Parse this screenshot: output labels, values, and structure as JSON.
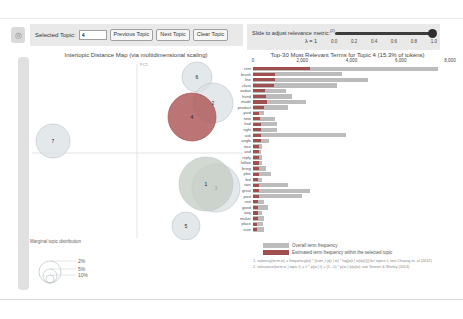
{
  "controls": {
    "selected_topic_label": "Selected Topic:",
    "selected_topic_value": "4",
    "prev_button": "Previous Topic",
    "next_button": "Next Topic",
    "clear_button": "Clear Topic",
    "slider_label": "Slide to adjust relevance metric:",
    "slider_superscript": "(2)",
    "lambda_label": "λ = 1",
    "slider_value": 1.0,
    "slider_ticks": [
      "0.0",
      "0.2",
      "0.4",
      "0.6",
      "0.8",
      "1.0"
    ]
  },
  "map": {
    "title": "Intertopic Distance Map (via multidimensional scaling)",
    "y_axis_label": "PC2",
    "selected_color": "#b05c5c",
    "default_color": "#d9e0e4",
    "topics": [
      {
        "id": "7",
        "x": 23,
        "y": 81,
        "r": 17,
        "selected": false,
        "fill": "#d9e0e4"
      },
      {
        "id": "6",
        "x": 167,
        "y": 17,
        "r": 15,
        "selected": false,
        "fill": "#d9e0e4"
      },
      {
        "id": "2",
        "x": 183,
        "y": 43,
        "r": 20,
        "selected": false,
        "fill": "#d9e0e4"
      },
      {
        "id": "4",
        "x": 162,
        "y": 57,
        "r": 24,
        "selected": true,
        "fill": "#b05c5c"
      },
      {
        "id": "3",
        "x": 186,
        "y": 128,
        "r": 24,
        "selected": false,
        "fill": "#d9e0e4"
      },
      {
        "id": "1",
        "x": 176,
        "y": 124,
        "r": 27,
        "selected": false,
        "fill": "#c3ccc1"
      },
      {
        "id": "5",
        "x": 156,
        "y": 166,
        "r": 14,
        "selected": false,
        "fill": "#d9e0e4"
      }
    ],
    "size_legend": {
      "title": "Marginal topic distribution",
      "sizes": [
        "2%",
        "5%",
        "10%"
      ]
    }
  },
  "chart_data": {
    "type": "bar",
    "title": "Top-30 Most Relevant Terms for Topic 4 (15.3% of tokens)",
    "xlim": [
      0,
      8000
    ],
    "x_ticks": [
      "0",
      "2,000",
      "4,000",
      "6,000",
      "8,000"
    ],
    "x_tick_values": [
      0,
      2000,
      4000,
      6000,
      8000
    ],
    "orientation": "horizontal",
    "categories": [
      "rent",
      "brush",
      "line",
      "class",
      "sedan",
      "hand",
      "made",
      "product",
      "yard",
      "new",
      "had",
      "right",
      "ask",
      "angle",
      "nice",
      "and",
      "reply",
      "follow",
      "bring",
      "plan",
      "but",
      "size",
      "great",
      "post",
      "unit",
      "good",
      "way",
      "maker",
      "place",
      "sure"
    ],
    "series": [
      {
        "name": "Overall term frequency",
        "color": "#bcbcbc",
        "values": [
          7500,
          3600,
          4650,
          3400,
          1330,
          1600,
          2160,
          1440,
          430,
          880,
          960,
          980,
          3760,
          640,
          380,
          330,
          350,
          360,
          520,
          720,
          360,
          1440,
          2320,
          1970,
          460,
          620,
          360,
          430,
          410,
          460
        ]
      },
      {
        "name": "Estimated term frequency within the selected topic",
        "color": "#a04f4f",
        "values": [
          2300,
          900,
          880,
          850,
          480,
          530,
          560,
          430,
          240,
          270,
          320,
          320,
          330,
          320,
          240,
          230,
          230,
          230,
          230,
          250,
          220,
          260,
          240,
          230,
          200,
          200,
          190,
          190,
          180,
          180
        ]
      }
    ],
    "legend_position": "bottom"
  },
  "footnotes": [
    "1. saliency(term w) = frequency(w) * [sum_t p(t | w) * log(p(t | w)/p(t))] for topics t; see Chuang et. al (2012)",
    "2. relevance(term w | topic t) = λ * p(w | t) + (1 - λ) * p(w | t)/p(w); see Sievert & Shirley (2014)"
  ]
}
